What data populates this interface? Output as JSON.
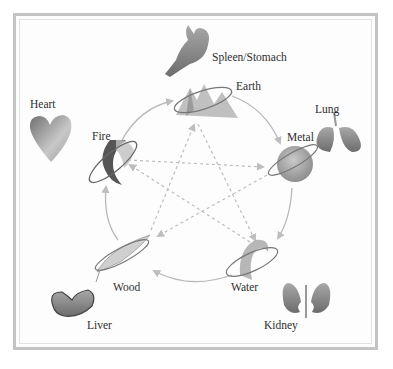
{
  "diagram": {
    "type": "five-elements-cycle",
    "colors": {
      "frame": "#c4c4c4",
      "arrow": "#b8b8b8",
      "dashed_arrow": "#bdbdbd",
      "text": "#2e2e2e"
    },
    "elements": [
      {
        "id": "earth",
        "label": "Earth",
        "organ": "Spleen/Stomach"
      },
      {
        "id": "metal",
        "label": "Metal",
        "organ": "Lung"
      },
      {
        "id": "water",
        "label": "Water",
        "organ": "Kidney"
      },
      {
        "id": "wood",
        "label": "Wood",
        "organ": "Liver"
      },
      {
        "id": "fire",
        "label": "Fire",
        "organ": "Heart"
      }
    ],
    "generating_cycle": [
      {
        "from": "Earth",
        "to": "Metal"
      },
      {
        "from": "Metal",
        "to": "Water"
      },
      {
        "from": "Water",
        "to": "Wood"
      },
      {
        "from": "Wood",
        "to": "Fire"
      },
      {
        "from": "Fire",
        "to": "Earth"
      }
    ],
    "controlling_cycle": [
      {
        "from": "Earth",
        "to": "Water"
      },
      {
        "from": "Water",
        "to": "Fire"
      },
      {
        "from": "Fire",
        "to": "Metal"
      },
      {
        "from": "Metal",
        "to": "Wood"
      },
      {
        "from": "Wood",
        "to": "Earth"
      }
    ]
  }
}
